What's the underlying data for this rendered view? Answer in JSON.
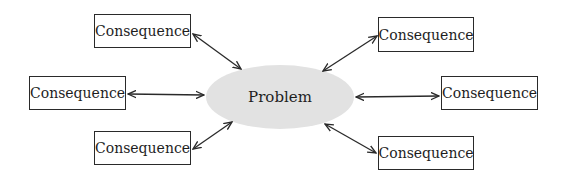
{
  "diagram": {
    "type": "cause-consequence map",
    "center": {
      "label": "Problem",
      "shape": "ellipse",
      "fill": "#e2e2e2",
      "cx": 280,
      "cy": 97,
      "rx": 74,
      "ry": 32
    },
    "nodes": [
      {
        "id": "top-left",
        "label": "Consequence",
        "x": 94,
        "y": 14,
        "w": 97,
        "h": 34
      },
      {
        "id": "middle-left",
        "label": "Consequence",
        "x": 29,
        "y": 76,
        "w": 97,
        "h": 34
      },
      {
        "id": "bottom-left",
        "label": "Consequence",
        "x": 94,
        "y": 131,
        "w": 97,
        "h": 34
      },
      {
        "id": "top-right",
        "label": "Consequence",
        "x": 378,
        "y": 17,
        "w": 96,
        "h": 35
      },
      {
        "id": "middle-right",
        "label": "Consequence",
        "x": 441,
        "y": 76,
        "w": 97,
        "h": 34
      },
      {
        "id": "bottom-right",
        "label": "Consequence",
        "x": 378,
        "y": 136,
        "w": 96,
        "h": 34
      }
    ],
    "edges": [
      {
        "from": "top-left",
        "to": "center",
        "direction": "bidirectional"
      },
      {
        "from": "middle-left",
        "to": "center",
        "direction": "bidirectional"
      },
      {
        "from": "bottom-left",
        "to": "center",
        "direction": "bidirectional"
      },
      {
        "from": "top-right",
        "to": "center",
        "direction": "bidirectional"
      },
      {
        "from": "middle-right",
        "to": "center",
        "direction": "bidirectional"
      },
      {
        "from": "bottom-right",
        "to": "center",
        "direction": "bidirectional"
      }
    ],
    "colors": {
      "stroke": "#2a2a2a",
      "ellipse_fill": "#e2e2e2",
      "background": "#ffffff"
    }
  }
}
